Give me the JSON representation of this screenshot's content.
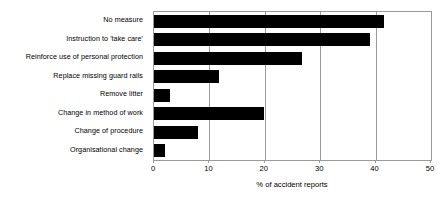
{
  "chart_data": {
    "type": "bar",
    "orientation": "horizontal",
    "title": "",
    "subtitle": "",
    "xlabel": "% of accident reports",
    "ylabel": "",
    "xlim": [
      0,
      50
    ],
    "xticks": [
      0,
      10,
      20,
      30,
      40,
      50
    ],
    "xtick_labels": [
      "0",
      "10",
      "20",
      "30",
      "40",
      "50"
    ],
    "grid": true,
    "grid_axis": "x",
    "legend": false,
    "legend_position": "none",
    "bar_color": "#000000",
    "axis_color": "#9a9a9a",
    "background_color": "#ffffff",
    "categories": [
      "No measure",
      "Instruction to 'take care'",
      "Reinforce use of personal protection",
      "Replace missing guard rails",
      "Remove litter",
      "Change in method of work",
      "Change of procedure",
      "Organisational change"
    ],
    "values": [
      41.5,
      39,
      26.8,
      11.8,
      2.8,
      19.9,
      8,
      2
    ],
    "series": [
      {
        "name": "% of accident reports",
        "values": [
          41.5,
          39,
          26.8,
          11.8,
          2.8,
          19.9,
          8,
          2
        ]
      }
    ]
  }
}
